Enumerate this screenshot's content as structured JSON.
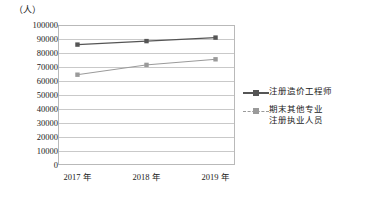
{
  "chart_data": {
    "type": "line",
    "title": "",
    "unit_label": "（人）",
    "xlabel": "",
    "ylabel": "",
    "categories": [
      "2017 年",
      "2018 年",
      "2019 年"
    ],
    "ylim": [
      0,
      100000
    ],
    "ytick_step": 10000,
    "yticks": [
      "100000",
      "90000",
      "80000",
      "70000",
      "60000",
      "50000",
      "40000",
      "30000",
      "20000",
      "10000",
      "0"
    ],
    "ytick_values": [
      100000,
      90000,
      80000,
      70000,
      60000,
      50000,
      40000,
      30000,
      20000,
      10000,
      0
    ],
    "grid": true,
    "legend_position": "right",
    "series": [
      {
        "name": "注册造价工程师",
        "name_lines": [
          "注册造价工程师"
        ],
        "values": [
          86000,
          88500,
          91000
        ],
        "color": "#555555",
        "style": "solid",
        "marker": "square"
      },
      {
        "name": "期末其他专业注册执业人员",
        "name_lines": [
          "期末其他专业",
          "注册执业人员"
        ],
        "values": [
          64500,
          71500,
          75500
        ],
        "color": "#9a9a9a",
        "style": "dashed",
        "marker": "square"
      }
    ]
  },
  "colors": {
    "series_dark": "#555555",
    "series_light": "#9a9a9a",
    "grid": "#c9c9c9",
    "frame": "#b9b9b9",
    "background": "#ffffff",
    "text": "#1a1a1a"
  }
}
